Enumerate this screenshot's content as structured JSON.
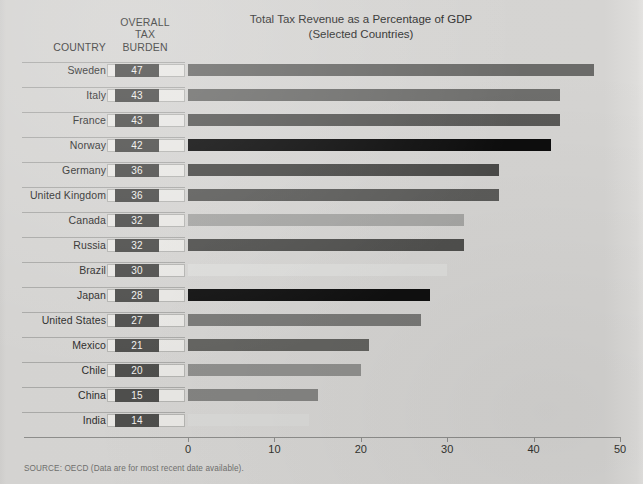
{
  "header": {
    "country_label": "COUNTRY",
    "burden_label_line1": "OVERALL",
    "burden_label_line2": "TAX",
    "burden_label_line3": "BURDEN",
    "top_note": ""
  },
  "source_note": "SOURCE: OECD (Data are for most recent date available).",
  "chart_data": {
    "type": "bar",
    "orientation": "horizontal",
    "title": "Total Tax Revenue as a Percentage of GDP",
    "subtitle": "(Selected Countries)",
    "xlabel": "",
    "ylabel": "",
    "xlim": [
      0,
      50
    ],
    "xticks": [
      0,
      10,
      20,
      30,
      40,
      50
    ],
    "xtick_labels": [
      "0",
      "10",
      "20",
      "30",
      "40",
      "50"
    ],
    "grid": false,
    "legend": "none",
    "categories": [
      "Sweden",
      "Italy",
      "France",
      "Norway",
      "Germany",
      "United Kingdom",
      "Canada",
      "Russia",
      "Brazil",
      "Japan",
      "United States",
      "Mexico",
      "Chile",
      "China",
      "India"
    ],
    "values": [
      47,
      43,
      43,
      42,
      36,
      36,
      32,
      32,
      30,
      28,
      27,
      21,
      20,
      15,
      14
    ],
    "bar_colors": [
      "#6b6b69",
      "#6e6e6c",
      "#595957",
      "#0d0d0d",
      "#4a4a48",
      "#5b5b59",
      "#a5a5a3",
      "#4f4f4d",
      "#dcdcda",
      "#0f0f0f",
      "#787876",
      "#62625f",
      "#8f8f8d",
      "#838381",
      "#d8d8d6"
    ],
    "value_badge_color": "#4e4e4c",
    "value_badge_text_color": "#f2f2ef"
  }
}
